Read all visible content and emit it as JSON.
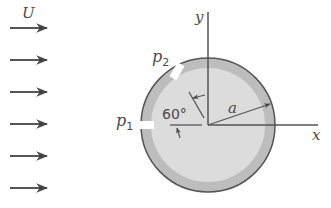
{
  "figure": {
    "flow_label": "U",
    "pressure_tap_1": "p",
    "pressure_tap_1_sub": "1",
    "pressure_tap_2": "p",
    "pressure_tap_2_sub": "2",
    "angle_label": "60°",
    "radius_label": "a",
    "x_axis_label": "x",
    "y_axis_label": "y",
    "arrow_count": 6
  },
  "colors": {
    "stroke": "#555555",
    "ring": "#bdbdbd",
    "disc": "#dcdcdc",
    "text": "#4a4a4a"
  }
}
